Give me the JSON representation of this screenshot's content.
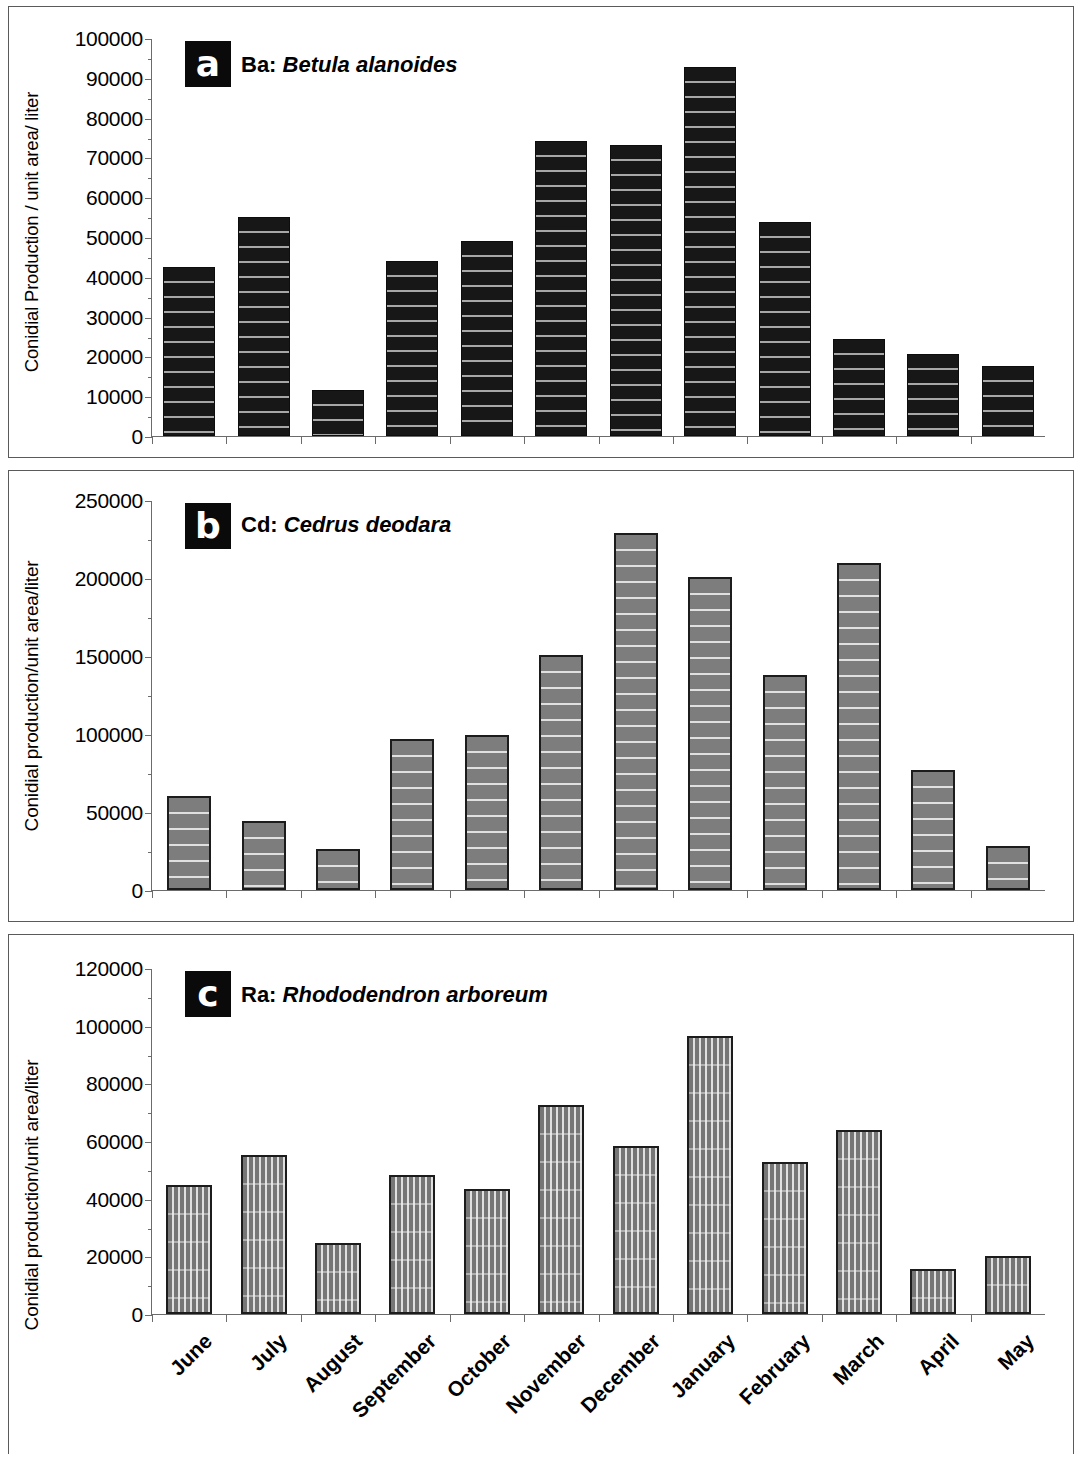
{
  "figure": {
    "panels": [
      {
        "badge": "a",
        "code": "Ba:",
        "species": "Betula alanoides",
        "ylabel": "Conidial Production / unit area/ liter"
      },
      {
        "badge": "b",
        "code": "Cd:",
        "species": "Cedrus deodara",
        "ylabel": "Conidial production/unit area/liter"
      },
      {
        "badge": "c",
        "code": "Ra:",
        "species": "Rhododendron arboreum",
        "ylabel": "Conidial production/unit area/liter"
      }
    ]
  },
  "chart_data": [
    {
      "type": "bar",
      "panel_label": "a",
      "title": "Ba: Betula alanoides",
      "xlabel": "",
      "ylabel": "Conidial Production / unit area/ liter",
      "ylim": [
        0,
        100000
      ],
      "yticks": [
        0,
        10000,
        20000,
        30000,
        40000,
        50000,
        60000,
        70000,
        80000,
        90000,
        100000
      ],
      "ytick_labels": [
        "0",
        "10000",
        "20000",
        "30000",
        "40000",
        "50000",
        "60000",
        "70000",
        "80000",
        "90000",
        "100000"
      ],
      "grid": false,
      "legend": "none",
      "bar_style": "black fill, horizontal hatch",
      "categories": [
        "June",
        "July",
        "August",
        "September",
        "October",
        "November",
        "December",
        "January",
        "February",
        "March",
        "April",
        "May"
      ],
      "values": [
        42500,
        55000,
        11500,
        44000,
        49000,
        74000,
        73000,
        92800,
        53800,
        24300,
        20700,
        17700
      ]
    },
    {
      "type": "bar",
      "panel_label": "b",
      "title": "Cd: Cedrus deodara",
      "xlabel": "",
      "ylabel": "Conidial production/unit area/liter",
      "ylim": [
        0,
        250000
      ],
      "yticks": [
        0,
        50000,
        100000,
        150000,
        200000,
        250000
      ],
      "ytick_labels": [
        "0",
        "50000",
        "100000",
        "150000",
        "200000",
        "250000"
      ],
      "grid": false,
      "legend": "none",
      "bar_style": "grey fill, horizontal hatch, dark border",
      "categories": [
        "June",
        "July",
        "August",
        "September",
        "October",
        "November",
        "December",
        "January",
        "February",
        "March",
        "April",
        "May"
      ],
      "values": [
        60000,
        44000,
        26000,
        96500,
        99500,
        150500,
        229000,
        200500,
        138000,
        209500,
        77000,
        28500
      ]
    },
    {
      "type": "bar",
      "panel_label": "c",
      "title": "Ra: Rhododendron arboreum",
      "xlabel": "",
      "ylabel": "Conidial production/unit area/liter",
      "ylim": [
        0,
        120000
      ],
      "yticks": [
        0,
        20000,
        40000,
        60000,
        80000,
        100000,
        120000
      ],
      "ytick_labels": [
        "0",
        "20000",
        "40000",
        "60000",
        "80000",
        "100000",
        "120000"
      ],
      "grid": false,
      "legend": "none",
      "bar_style": "grey fill, vertical hatch, dark border",
      "categories": [
        "June",
        "July",
        "August",
        "September",
        "October",
        "November",
        "December",
        "January",
        "February",
        "March",
        "April",
        "May"
      ],
      "values": [
        44800,
        55000,
        24500,
        48300,
        43500,
        72500,
        58400,
        96300,
        52600,
        63700,
        15600,
        20200
      ]
    }
  ],
  "xaxis": {
    "categories": [
      "June",
      "July",
      "August",
      "September",
      "October",
      "November",
      "December",
      "January",
      "February",
      "March",
      "April",
      "May"
    ]
  }
}
